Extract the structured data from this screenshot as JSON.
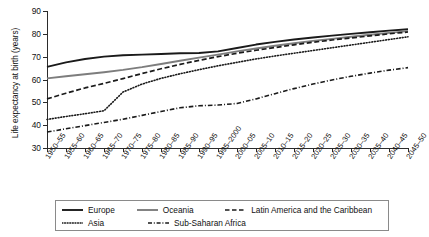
{
  "chart_data": {
    "type": "line",
    "title": "",
    "xlabel": "",
    "ylabel": "Life expectancy at birth (years)",
    "ylim": [
      30,
      90
    ],
    "yticks": [
      30,
      40,
      50,
      60,
      70,
      80,
      90
    ],
    "grid": false,
    "legend_position": "bottom",
    "categories": [
      "1950–55",
      "1955–60",
      "1960–65",
      "1965–70",
      "1970–75",
      "1975–80",
      "1980–85",
      "1985–90",
      "1990–95",
      "1995–2000",
      "2000–05",
      "2005–10",
      "2010–15",
      "2015–20",
      "2020–25",
      "2025–30",
      "2030–35",
      "2035–40",
      "2040–45",
      "2045–50"
    ],
    "series": [
      {
        "name": "Europe",
        "style": "solid",
        "color": "#1a1a1a",
        "values": [
          65.5,
          67.5,
          69.0,
          70.0,
          70.6,
          70.9,
          71.2,
          71.5,
          71.6,
          72.3,
          73.8,
          75.3,
          76.5,
          77.5,
          78.4,
          79.2,
          80.0,
          80.7,
          81.4,
          82.0
        ]
      },
      {
        "name": "Oceania",
        "style": "solid",
        "color": "#7d7d7d",
        "values": [
          60.5,
          61.4,
          62.3,
          63.2,
          64.2,
          65.4,
          66.8,
          68.2,
          69.6,
          70.9,
          72.3,
          73.6,
          74.8,
          75.9,
          76.9,
          77.8,
          78.7,
          79.6,
          80.4,
          81.2
        ]
      },
      {
        "name": "Latin America and the Caribbean",
        "style": "dashed",
        "color": "#1a1a1a",
        "values": [
          51.5,
          54.0,
          56.3,
          58.3,
          60.4,
          62.6,
          64.7,
          66.6,
          68.4,
          70.0,
          71.5,
          72.8,
          74.0,
          75.2,
          76.3,
          77.3,
          78.2,
          79.1,
          80.0,
          80.8
        ]
      },
      {
        "name": "Asia",
        "style": "dotted",
        "color": "#1a1a1a",
        "values": [
          42.5,
          43.8,
          45.0,
          46.3,
          54.5,
          58.0,
          60.5,
          62.5,
          64.3,
          66.0,
          67.5,
          69.0,
          70.3,
          71.5,
          72.7,
          73.9,
          75.1,
          76.3,
          77.5,
          78.7
        ]
      },
      {
        "name": "Sub-Saharan Africa",
        "style": "dashdot",
        "color": "#1a1a1a",
        "values": [
          37.0,
          38.4,
          39.8,
          41.2,
          42.6,
          44.3,
          46.0,
          47.6,
          48.5,
          48.8,
          49.5,
          51.5,
          53.8,
          56.0,
          58.0,
          59.8,
          61.4,
          62.8,
          64.1,
          65.2
        ]
      }
    ]
  },
  "legend": {
    "entries": [
      {
        "label": "Europe",
        "icon": "solid-line-swatch"
      },
      {
        "label": "Oceania",
        "icon": "solid-line-swatch"
      },
      {
        "label": "Latin America and the Caribbean",
        "icon": "dashed-line-swatch"
      },
      {
        "label": "Asia",
        "icon": "dotted-line-swatch"
      },
      {
        "label": "Sub-Saharan Africa",
        "icon": "dashdot-line-swatch"
      }
    ]
  }
}
